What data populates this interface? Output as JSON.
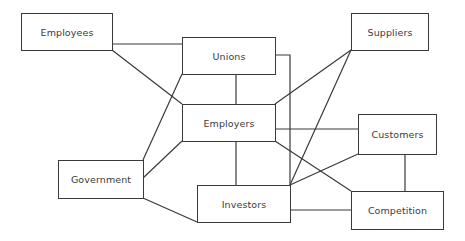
{
  "diagram": {
    "type": "stakeholder-network",
    "nodes": [
      {
        "id": "employees",
        "label": "Employees"
      },
      {
        "id": "unions",
        "label": "Unions"
      },
      {
        "id": "suppliers",
        "label": "Suppliers"
      },
      {
        "id": "employers",
        "label": "Employers"
      },
      {
        "id": "customers",
        "label": "Customers"
      },
      {
        "id": "government",
        "label": "Government"
      },
      {
        "id": "investors",
        "label": "Investors"
      },
      {
        "id": "competition",
        "label": "Competition"
      }
    ],
    "edges": [
      [
        "employees",
        "unions"
      ],
      [
        "employees",
        "employers"
      ],
      [
        "unions",
        "employers"
      ],
      [
        "unions",
        "investors"
      ],
      [
        "unions",
        "government"
      ],
      [
        "employers",
        "government"
      ],
      [
        "government",
        "investors"
      ],
      [
        "employers",
        "investors"
      ],
      [
        "employers",
        "suppliers"
      ],
      [
        "investors",
        "suppliers"
      ],
      [
        "employers",
        "customers"
      ],
      [
        "employers",
        "competition"
      ],
      [
        "investors",
        "customers"
      ],
      [
        "investors",
        "competition"
      ],
      [
        "customers",
        "competition"
      ]
    ],
    "colors": {
      "line": "#3a3a3a",
      "background": "#ffffff",
      "text": "#3a3a3a"
    }
  }
}
